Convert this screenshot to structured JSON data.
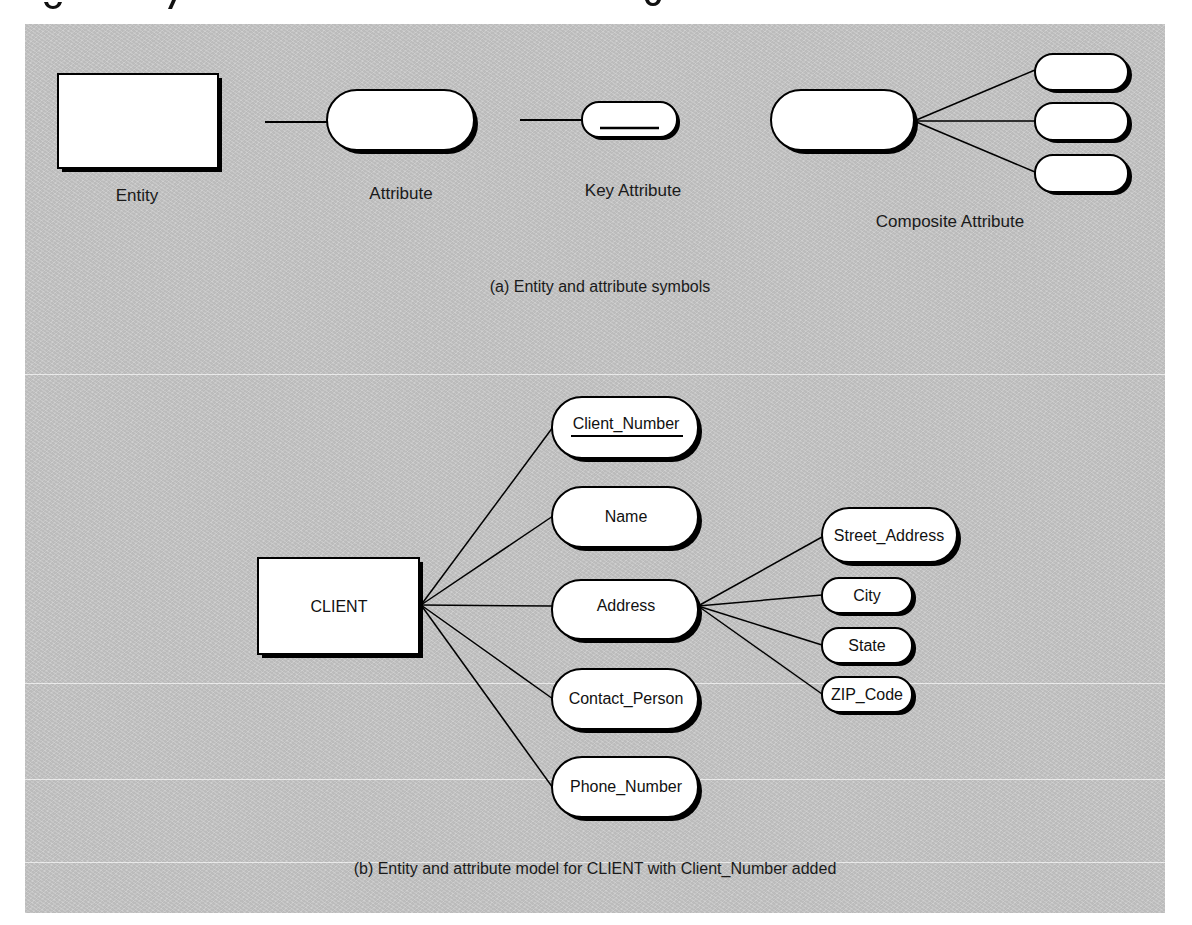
{
  "figure": {
    "clipped_header_fragment": "",
    "panel_color": "#c9c9c9",
    "shape_fill": "#ffffff",
    "stroke_color": "#000000"
  },
  "legend_section": {
    "caption": "(a) Entity and attribute symbols",
    "symbols": [
      {
        "id": "entity",
        "label": "Entity",
        "shape": "rectangle"
      },
      {
        "id": "attribute",
        "label": "Attribute",
        "shape": "rounded-pill"
      },
      {
        "id": "key_attribute",
        "label": "Key Attribute",
        "shape": "rounded-pill-underlined"
      },
      {
        "id": "composite_attribute",
        "label": "Composite Attribute",
        "shape": "pill-with-3-subpills"
      }
    ]
  },
  "model_section": {
    "caption": "(b) Entity and attribute model for CLIENT with Client_Number added",
    "entity": {
      "name": "CLIENT"
    },
    "attributes": [
      {
        "name": "Client_Number",
        "key": true
      },
      {
        "name": "Name",
        "key": false
      },
      {
        "name": "Address",
        "key": false,
        "components": [
          "Street_Address",
          "City",
          "State",
          "ZIP_Code"
        ]
      },
      {
        "name": "Contact_Person",
        "key": false
      },
      {
        "name": "Phone_Number",
        "key": false
      }
    ]
  }
}
